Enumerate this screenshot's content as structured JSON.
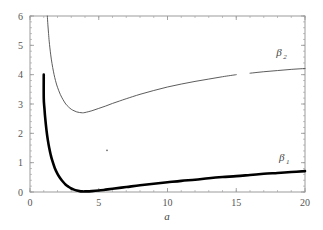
{
  "chart_data": {
    "type": "line",
    "title": "",
    "subtitle": "",
    "xlabel": "a",
    "ylabel": "",
    "xlim": [
      0,
      20
    ],
    "ylim": [
      0,
      6
    ],
    "grid": false,
    "legend_position": "inline-right",
    "x_ticks": [
      0,
      5,
      10,
      15,
      20
    ],
    "x_tick_labels": [
      "0",
      "5",
      "10",
      "15",
      "20"
    ],
    "x_minor_step": 1,
    "y_ticks": [
      0,
      1,
      2,
      3,
      4,
      5,
      6
    ],
    "y_tick_labels": [
      "0",
      "1",
      "2",
      "3",
      "4",
      "5",
      "6"
    ],
    "y_minor_step": 0.2,
    "series": [
      {
        "name": "beta_1",
        "label": "β",
        "label_sub": "1",
        "style": "thick",
        "color": "#000000",
        "width": 2.6,
        "label_x": 18.1,
        "label_y": 1.05,
        "x": [
          1.0,
          1.0,
          1.05,
          1.1,
          1.2,
          1.3,
          1.4,
          1.5,
          1.6,
          1.8,
          2.0,
          2.2,
          2.4,
          2.6,
          2.8,
          3.0,
          3.2,
          3.4,
          3.6,
          3.8,
          4.0,
          4.5,
          5.0,
          5.5,
          6.0,
          7.0,
          8.0,
          9.0,
          10.0,
          11.0,
          12.0,
          13.0,
          14.0,
          15.0,
          16.0,
          17.0,
          18.0,
          19.0,
          20.0
        ],
        "y": [
          4.0,
          3.2,
          2.85,
          2.55,
          2.1,
          1.76,
          1.5,
          1.28,
          1.1,
          0.82,
          0.62,
          0.47,
          0.35,
          0.25,
          0.18,
          0.12,
          0.08,
          0.05,
          0.03,
          0.02,
          0.02,
          0.03,
          0.05,
          0.08,
          0.11,
          0.17,
          0.23,
          0.28,
          0.33,
          0.38,
          0.42,
          0.47,
          0.51,
          0.54,
          0.58,
          0.62,
          0.65,
          0.68,
          0.71
        ]
      },
      {
        "name": "beta_2",
        "label": "β",
        "label_sub": "2",
        "style": "thin",
        "color": "#4a4a4a",
        "width": 0.9,
        "label_x": 17.9,
        "label_y": 4.65,
        "gap_x": [
          15.1,
          15.9
        ],
        "x": [
          1.26,
          1.3,
          1.35,
          1.4,
          1.5,
          1.6,
          1.7,
          1.8,
          1.9,
          2.0,
          2.2,
          2.4,
          2.6,
          2.8,
          3.0,
          3.2,
          3.4,
          3.6,
          3.8,
          4.0,
          4.5,
          5.0,
          5.5,
          6.0,
          6.5,
          7.0,
          8.0,
          9.0,
          10.0,
          11.0,
          12.0,
          13.0,
          14.0,
          15.0,
          16.0,
          17.0,
          18.0,
          19.0,
          20.0
        ],
        "y": [
          6.0,
          5.7,
          5.4,
          5.12,
          4.7,
          4.38,
          4.12,
          3.9,
          3.72,
          3.57,
          3.33,
          3.15,
          3.0,
          2.9,
          2.82,
          2.77,
          2.73,
          2.71,
          2.7,
          2.71,
          2.77,
          2.85,
          2.93,
          3.02,
          3.1,
          3.18,
          3.33,
          3.46,
          3.58,
          3.68,
          3.77,
          3.85,
          3.93,
          4.0,
          4.05,
          4.1,
          4.14,
          4.18,
          4.21
        ]
      }
    ],
    "annotations": [
      {
        "name": "stray-dot",
        "x": 5.6,
        "y": 1.42,
        "r": 0.9
      }
    ],
    "colors": {
      "frame": "#9b9b9b",
      "tick": "#9b9b9b",
      "text": "#555555",
      "background": "#ffffff",
      "series_1": "#000000",
      "series_2": "#4a4a4a"
    }
  }
}
